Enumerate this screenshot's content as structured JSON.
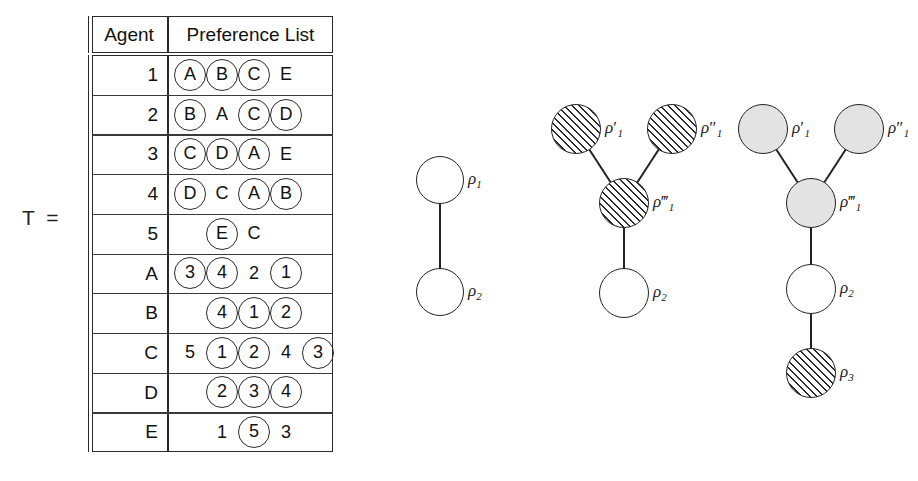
{
  "figure": {
    "matrix_label": "T =",
    "table": {
      "headers": [
        "Agent",
        "Preference List"
      ],
      "rows": [
        {
          "agent": "1",
          "prefs": [
            {
              "text": "A",
              "circled": true,
              "col": 0
            },
            {
              "text": "B",
              "circled": true,
              "col": 1
            },
            {
              "text": "C",
              "circled": true,
              "col": 2
            },
            {
              "text": "E",
              "circled": false,
              "col": 3
            }
          ]
        },
        {
          "agent": "2",
          "prefs": [
            {
              "text": "B",
              "circled": true,
              "col": 0
            },
            {
              "text": "A",
              "circled": false,
              "col": 1
            },
            {
              "text": "C",
              "circled": true,
              "col": 2
            },
            {
              "text": "D",
              "circled": true,
              "col": 3
            }
          ]
        },
        {
          "agent": "3",
          "prefs": [
            {
              "text": "C",
              "circled": true,
              "col": 0
            },
            {
              "text": "D",
              "circled": true,
              "col": 1
            },
            {
              "text": "A",
              "circled": true,
              "col": 2
            },
            {
              "text": "E",
              "circled": false,
              "col": 3
            }
          ]
        },
        {
          "agent": "4",
          "prefs": [
            {
              "text": "D",
              "circled": true,
              "col": 0
            },
            {
              "text": "C",
              "circled": false,
              "col": 1
            },
            {
              "text": "A",
              "circled": true,
              "col": 2
            },
            {
              "text": "B",
              "circled": true,
              "col": 3
            }
          ]
        },
        {
          "agent": "5",
          "prefs": [
            {
              "text": "E",
              "circled": true,
              "col": 1
            },
            {
              "text": "C",
              "circled": false,
              "col": 2
            }
          ]
        },
        {
          "agent": "A",
          "prefs": [
            {
              "text": "3",
              "circled": true,
              "col": 0
            },
            {
              "text": "4",
              "circled": true,
              "col": 1
            },
            {
              "text": "2",
              "circled": false,
              "col": 2
            },
            {
              "text": "1",
              "circled": true,
              "col": 3
            }
          ]
        },
        {
          "agent": "B",
          "prefs": [
            {
              "text": "4",
              "circled": true,
              "col": 1
            },
            {
              "text": "1",
              "circled": true,
              "col": 2
            },
            {
              "text": "2",
              "circled": true,
              "col": 3
            }
          ]
        },
        {
          "agent": "C",
          "prefs": [
            {
              "text": "5",
              "circled": false,
              "col": 0
            },
            {
              "text": "1",
              "circled": true,
              "col": 1
            },
            {
              "text": "2",
              "circled": true,
              "col": 2
            },
            {
              "text": "4",
              "circled": false,
              "col": 3
            },
            {
              "text": "3",
              "circled": true,
              "col": 4
            }
          ]
        },
        {
          "agent": "D",
          "prefs": [
            {
              "text": "2",
              "circled": true,
              "col": 1
            },
            {
              "text": "3",
              "circled": true,
              "col": 2
            },
            {
              "text": "4",
              "circled": true,
              "col": 3
            }
          ]
        },
        {
          "agent": "E",
          "prefs": [
            {
              "text": "1",
              "circled": false,
              "col": 1
            },
            {
              "text": "5",
              "circled": true,
              "col": 2
            },
            {
              "text": "3",
              "circled": false,
              "col": 3
            }
          ]
        }
      ]
    },
    "graphs": [
      {
        "name": "graph-left",
        "nodes": [
          {
            "id": "rho1",
            "label": "ρ",
            "sub": "1",
            "primes": "",
            "fill": "white",
            "x": 18,
            "y": 18,
            "r": 24
          },
          {
            "id": "rho2",
            "label": "ρ",
            "sub": "2",
            "primes": "",
            "fill": "white",
            "x": 18,
            "y": 130,
            "r": 24
          }
        ],
        "edges": [
          [
            "rho1",
            "rho2"
          ]
        ]
      },
      {
        "name": "graph-middle",
        "nodes": [
          {
            "id": "rho1p",
            "label": "ρ",
            "sub": "1",
            "primes": "′",
            "fill": "hatch",
            "x": 8,
            "y": 4,
            "r": 25
          },
          {
            "id": "rho1pp",
            "label": "ρ",
            "sub": "1",
            "primes": "″",
            "fill": "hatch",
            "x": 104,
            "y": 4,
            "r": 25
          },
          {
            "id": "rho1ppp",
            "label": "ρ",
            "sub": "1",
            "primes": "‴",
            "fill": "hatch",
            "x": 56,
            "y": 78,
            "r": 25
          },
          {
            "id": "rho2",
            "label": "ρ",
            "sub": "2",
            "primes": "",
            "fill": "white",
            "x": 56,
            "y": 168,
            "r": 25
          }
        ],
        "edges": [
          [
            "rho1p",
            "rho1ppp"
          ],
          [
            "rho1pp",
            "rho1ppp"
          ],
          [
            "rho1ppp",
            "rho2"
          ]
        ]
      },
      {
        "name": "graph-right",
        "nodes": [
          {
            "id": "rho1p",
            "label": "ρ",
            "sub": "1",
            "primes": "′",
            "fill": "gray",
            "x": 8,
            "y": 4,
            "r": 25
          },
          {
            "id": "rho1pp",
            "label": "ρ",
            "sub": "1",
            "primes": "″",
            "fill": "gray",
            "x": 104,
            "y": 4,
            "r": 25
          },
          {
            "id": "rho1ppp",
            "label": "ρ",
            "sub": "1",
            "primes": "‴",
            "fill": "gray",
            "x": 56,
            "y": 78,
            "r": 25
          },
          {
            "id": "rho2",
            "label": "ρ",
            "sub": "2",
            "primes": "",
            "fill": "white",
            "x": 56,
            "y": 164,
            "r": 25
          },
          {
            "id": "rho3",
            "label": "ρ",
            "sub": "3",
            "primes": "",
            "fill": "hatch",
            "x": 56,
            "y": 248,
            "r": 25
          }
        ],
        "edges": [
          [
            "rho1p",
            "rho1ppp"
          ],
          [
            "rho1pp",
            "rho1ppp"
          ],
          [
            "rho1ppp",
            "rho2"
          ],
          [
            "rho2",
            "rho3"
          ]
        ]
      }
    ],
    "colors": {
      "stroke": "#232323",
      "gray_fill": "#e3e3e3",
      "hatch_line": "#2a2a2a"
    }
  }
}
